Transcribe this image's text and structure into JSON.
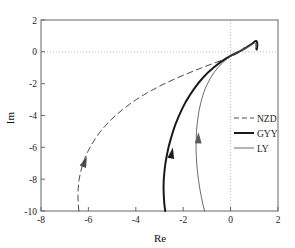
{
  "chart_data": {
    "type": "line",
    "title": "",
    "xlabel": "Re",
    "ylabel": "Im",
    "xlim": [
      -8,
      2
    ],
    "ylim": [
      -10,
      2
    ],
    "xticks": [
      -8,
      -6,
      -4,
      -2,
      0,
      2
    ],
    "xtick_labels": [
      "-8",
      "-6",
      "-4",
      "-2",
      "0",
      "2"
    ],
    "yticks": [
      2,
      0,
      -2,
      -4,
      -6,
      -8,
      -10
    ],
    "ytick_labels": [
      "2",
      "0",
      "-2",
      "-4",
      "-6",
      "-8",
      "-10"
    ],
    "grid": "dotted-zero-lines",
    "gridlines": [
      {
        "axis": "y",
        "value": 0,
        "style": "dotted"
      },
      {
        "axis": "x",
        "value": 0,
        "style": "dotted"
      }
    ],
    "legend_position": "right-middle",
    "series": [
      {
        "name": "NZD",
        "style": "dashed",
        "color": "#4a4a4a",
        "width": 1.0,
        "arrow_at": {
          "x": -6.15,
          "y": -6.9
        },
        "points": [
          [
            -6.4,
            -10.0
          ],
          [
            -6.43,
            -9.55
          ],
          [
            -6.44,
            -9.1
          ],
          [
            -6.43,
            -8.6
          ],
          [
            -6.4,
            -8.1
          ],
          [
            -6.34,
            -7.62
          ],
          [
            -6.26,
            -7.16
          ],
          [
            -6.16,
            -6.72
          ],
          [
            -6.03,
            -6.28
          ],
          [
            -5.88,
            -5.86
          ],
          [
            -5.71,
            -5.45
          ],
          [
            -5.52,
            -5.06
          ],
          [
            -5.31,
            -4.68
          ],
          [
            -5.08,
            -4.32
          ],
          [
            -4.83,
            -3.97
          ],
          [
            -4.56,
            -3.63
          ],
          [
            -4.28,
            -3.31
          ],
          [
            -3.98,
            -3.0
          ],
          [
            -3.66,
            -2.7
          ],
          [
            -3.33,
            -2.42
          ],
          [
            -2.99,
            -2.15
          ],
          [
            -2.63,
            -1.89
          ],
          [
            -2.26,
            -1.64
          ],
          [
            -1.88,
            -1.4
          ],
          [
            -1.49,
            -1.16
          ],
          [
            -1.09,
            -0.93
          ],
          [
            -0.68,
            -0.7
          ],
          [
            -0.26,
            -0.47
          ],
          [
            0.1,
            -0.24
          ],
          [
            0.36,
            -0.04
          ],
          [
            0.52,
            0.14
          ],
          [
            0.58,
            0.28
          ]
        ]
      },
      {
        "name": "GYY",
        "style": "solid",
        "color": "#1a1a1a",
        "width": 2.0,
        "arrow_at": {
          "x": -2.48,
          "y": -6.35
        },
        "points": [
          [
            -2.76,
            -10.0
          ],
          [
            -2.8,
            -9.5
          ],
          [
            -2.82,
            -9.0
          ],
          [
            -2.83,
            -8.5
          ],
          [
            -2.82,
            -8.0
          ],
          [
            -2.79,
            -7.5
          ],
          [
            -2.75,
            -7.0
          ],
          [
            -2.69,
            -6.5
          ],
          [
            -2.62,
            -6.0
          ],
          [
            -2.53,
            -5.5
          ],
          [
            -2.43,
            -5.0
          ],
          [
            -2.32,
            -4.52
          ],
          [
            -2.19,
            -4.05
          ],
          [
            -2.05,
            -3.6
          ],
          [
            -1.9,
            -3.16
          ],
          [
            -1.73,
            -2.74
          ],
          [
            -1.55,
            -2.34
          ],
          [
            -1.36,
            -1.96
          ],
          [
            -1.15,
            -1.6
          ],
          [
            -0.93,
            -1.26
          ],
          [
            -0.69,
            -0.95
          ],
          [
            -0.44,
            -0.66
          ],
          [
            -0.17,
            -0.4
          ],
          [
            0.11,
            -0.16
          ],
          [
            0.4,
            0.05
          ],
          [
            0.66,
            0.26
          ],
          [
            0.85,
            0.45
          ],
          [
            0.98,
            0.6
          ],
          [
            1.05,
            0.68
          ],
          [
            1.09,
            0.68
          ],
          [
            1.12,
            0.6
          ],
          [
            1.13,
            0.45
          ],
          [
            1.12,
            0.28
          ],
          [
            1.1,
            0.14
          ]
        ]
      },
      {
        "name": "LY",
        "style": "thin",
        "color": "#5a5a5a",
        "width": 0.9,
        "arrow_at": {
          "x": -1.36,
          "y": -5.4
        },
        "points": [
          [
            -1.1,
            -10.0
          ],
          [
            -1.18,
            -9.5
          ],
          [
            -1.25,
            -9.0
          ],
          [
            -1.31,
            -8.5
          ],
          [
            -1.36,
            -8.0
          ],
          [
            -1.4,
            -7.5
          ],
          [
            -1.43,
            -7.0
          ],
          [
            -1.45,
            -6.5
          ],
          [
            -1.46,
            -6.0
          ],
          [
            -1.45,
            -5.5
          ],
          [
            -1.44,
            -5.0
          ],
          [
            -1.41,
            -4.52
          ],
          [
            -1.37,
            -4.05
          ],
          [
            -1.32,
            -3.6
          ],
          [
            -1.25,
            -3.16
          ],
          [
            -1.17,
            -2.74
          ],
          [
            -1.08,
            -2.34
          ],
          [
            -0.96,
            -1.96
          ],
          [
            -0.83,
            -1.6
          ],
          [
            -0.68,
            -1.26
          ],
          [
            -0.51,
            -0.95
          ],
          [
            -0.32,
            -0.66
          ],
          [
            -0.11,
            -0.4
          ],
          [
            0.12,
            -0.17
          ],
          [
            0.37,
            0.03
          ],
          [
            0.6,
            0.21
          ],
          [
            0.78,
            0.36
          ],
          [
            0.91,
            0.47
          ],
          [
            0.99,
            0.54
          ],
          [
            1.03,
            0.56
          ],
          [
            1.05,
            0.52
          ],
          [
            1.06,
            0.42
          ],
          [
            1.06,
            0.3
          ],
          [
            1.05,
            0.18
          ]
        ]
      }
    ],
    "legend_entries": [
      {
        "label": "NZD",
        "style": "dashed"
      },
      {
        "label": "GYY",
        "style": "solid"
      },
      {
        "label": "LY",
        "style": "thin"
      }
    ]
  }
}
